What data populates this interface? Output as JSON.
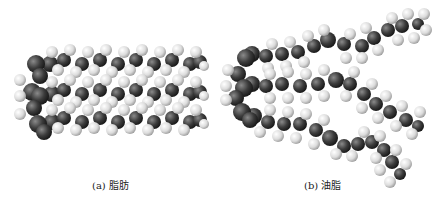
{
  "figure": {
    "panels": [
      {
        "id": "a",
        "caption": "(a) 脂肪",
        "subject": "fat molecule (saturated, straight chains)"
      },
      {
        "id": "b",
        "caption": "(b) 油脂",
        "subject": "oil molecule (unsaturated, kinked chains)"
      }
    ],
    "colors": {
      "carbon": "#3a3a3a",
      "hydrogen": "#e4e4e4",
      "background": "#ffffff"
    }
  }
}
